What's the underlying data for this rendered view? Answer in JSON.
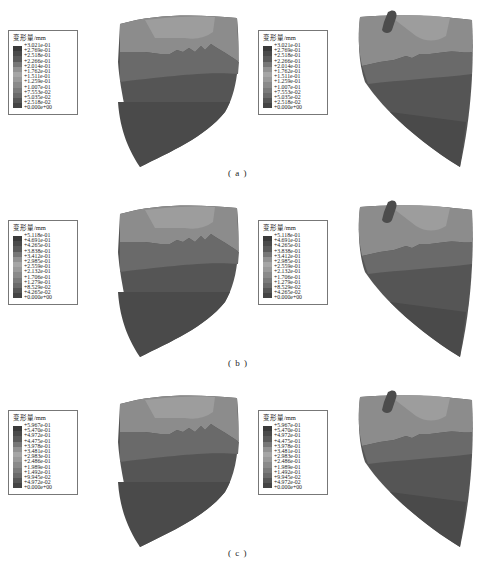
{
  "figure": {
    "legend_title": "变形量/mm",
    "rows": [
      {
        "caption": "( a )",
        "legend_values": [
          "+3.021e-01",
          "+2.769e-01",
          "+2.518e-01",
          "+2.266e-01",
          "+2.014e-01",
          "+1.762e-01",
          "+1.511e-01",
          "+1.259e-01",
          "+1.007e-01",
          "+7.553e-02",
          "+5.035e-02",
          "+2.518e-02",
          "+0.000e+00"
        ]
      },
      {
        "caption": "( b )",
        "legend_values": [
          "+5.118e-01",
          "+4.691e-01",
          "+4.265e-01",
          "+3.838e-01",
          "+3.412e-01",
          "+2.985e-01",
          "+2.559e-01",
          "+2.132e-01",
          "+1.706e-01",
          "+1.279e-01",
          "+8.529e-02",
          "+4.265e-02",
          "+0.000e+00"
        ]
      },
      {
        "caption": "( c )",
        "legend_values": [
          "+5.967e-01",
          "+5.470e-01",
          "+4.972e-01",
          "+4.475e-01",
          "+3.978e-01",
          "+3.481e-01",
          "+2.983e-01",
          "+2.486e-01",
          "+1.989e-01",
          "+1.492e-01",
          "+9.945e-02",
          "+4.972e-02",
          "+0.000e+00"
        ]
      }
    ],
    "colormap": [
      "#3a3a3a",
      "#4a4a4a",
      "#5a5a5a",
      "#777777",
      "#929292",
      "#a6a6a6",
      "#9a9a9a",
      "#8a8a8a",
      "#7a7a7a",
      "#6a6a6a",
      "#555555",
      "#444444"
    ],
    "shape_colors": {
      "top_light": "#9d9d9d",
      "top_mid": "#8c8c8c",
      "band": "#6a6a6a",
      "body_dark": "#555555",
      "bottom_darkest": "#4a4a4a",
      "spot": "#4c4c4c"
    }
  }
}
